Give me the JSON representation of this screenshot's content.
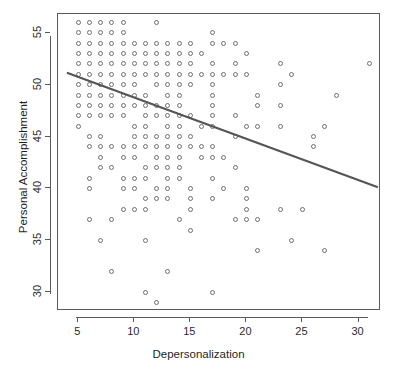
{
  "chart_data": {
    "type": "scatter",
    "title": "",
    "xlabel": "Depersonalization",
    "ylabel": "Personal Accomplishment",
    "xlim": [
      3.2,
      32.0
    ],
    "ylim": [
      28.2,
      56.8
    ],
    "xticks": [
      5,
      10,
      15,
      20,
      25,
      30
    ],
    "xticklabels": [
      "5",
      "10",
      "15",
      "20",
      "25",
      "30"
    ],
    "yticks": [
      30,
      35,
      40,
      45,
      50,
      55
    ],
    "yticklabels": [
      "30",
      "35",
      "40",
      "45",
      "50",
      "55"
    ],
    "grid": false,
    "legend": null,
    "marker": "open-circle",
    "marker_color": "#6e6e6e",
    "line_color": "#555555",
    "frame_color": "#5a5a5a",
    "background": "#ffffff",
    "regression_line": {
      "type": "linear-fit",
      "x_start": 4.0,
      "y_start": 51.1,
      "x_end": 31.9,
      "y_end": 40.0,
      "slope": -0.398,
      "intercept": 52.69
    },
    "points": [
      [
        5,
        56
      ],
      [
        6,
        56
      ],
      [
        7,
        56
      ],
      [
        8,
        56
      ],
      [
        9,
        56
      ],
      [
        12,
        56
      ],
      [
        5,
        55
      ],
      [
        6,
        55
      ],
      [
        7,
        55
      ],
      [
        8,
        55
      ],
      [
        9,
        55
      ],
      [
        17,
        55
      ],
      [
        5,
        54
      ],
      [
        6,
        54
      ],
      [
        7,
        54
      ],
      [
        8,
        54
      ],
      [
        9,
        54
      ],
      [
        10,
        54
      ],
      [
        11,
        54
      ],
      [
        12,
        54
      ],
      [
        13,
        54
      ],
      [
        14,
        54
      ],
      [
        15,
        54
      ],
      [
        17,
        54
      ],
      [
        18,
        54
      ],
      [
        19,
        54
      ],
      [
        5,
        53
      ],
      [
        6,
        53
      ],
      [
        7,
        53
      ],
      [
        8,
        53
      ],
      [
        9,
        53
      ],
      [
        10,
        53
      ],
      [
        11,
        53
      ],
      [
        12,
        53
      ],
      [
        13,
        53
      ],
      [
        14,
        53
      ],
      [
        15,
        53
      ],
      [
        16,
        53
      ],
      [
        20,
        53
      ],
      [
        5,
        52
      ],
      [
        6,
        52
      ],
      [
        7,
        52
      ],
      [
        8,
        52
      ],
      [
        9,
        52
      ],
      [
        10,
        52
      ],
      [
        11,
        52
      ],
      [
        12,
        52
      ],
      [
        13,
        52
      ],
      [
        14,
        52
      ],
      [
        15,
        52
      ],
      [
        17,
        52
      ],
      [
        19,
        52
      ],
      [
        23,
        52
      ],
      [
        31,
        52
      ],
      [
        5,
        51
      ],
      [
        6,
        51
      ],
      [
        7,
        51
      ],
      [
        8,
        51
      ],
      [
        9,
        51
      ],
      [
        10,
        51
      ],
      [
        11,
        51
      ],
      [
        12,
        51
      ],
      [
        13,
        51
      ],
      [
        14,
        51
      ],
      [
        15,
        51
      ],
      [
        16,
        51
      ],
      [
        17,
        51
      ],
      [
        18,
        51
      ],
      [
        19,
        51
      ],
      [
        20,
        51
      ],
      [
        24,
        51
      ],
      [
        5,
        50
      ],
      [
        6,
        50
      ],
      [
        7,
        50
      ],
      [
        8,
        50
      ],
      [
        9,
        50
      ],
      [
        10,
        50
      ],
      [
        12,
        50
      ],
      [
        13,
        50
      ],
      [
        14,
        50
      ],
      [
        15,
        50
      ],
      [
        17,
        50
      ],
      [
        23,
        50
      ],
      [
        5,
        49
      ],
      [
        6,
        49
      ],
      [
        7,
        49
      ],
      [
        8,
        49
      ],
      [
        9,
        49
      ],
      [
        10,
        49
      ],
      [
        11,
        49
      ],
      [
        13,
        49
      ],
      [
        14,
        49
      ],
      [
        17,
        49
      ],
      [
        21,
        49
      ],
      [
        28,
        49
      ],
      [
        5,
        48
      ],
      [
        6,
        48
      ],
      [
        7,
        48
      ],
      [
        8,
        48
      ],
      [
        9,
        48
      ],
      [
        10,
        48
      ],
      [
        11,
        48
      ],
      [
        12,
        48
      ],
      [
        13,
        48
      ],
      [
        14,
        48
      ],
      [
        17,
        48
      ],
      [
        21,
        48
      ],
      [
        23,
        48
      ],
      [
        5,
        47
      ],
      [
        6,
        47
      ],
      [
        7,
        47
      ],
      [
        8,
        47
      ],
      [
        9,
        47
      ],
      [
        11,
        47
      ],
      [
        12,
        47
      ],
      [
        13,
        47
      ],
      [
        14,
        47
      ],
      [
        15,
        47
      ],
      [
        17,
        47
      ],
      [
        19,
        47
      ],
      [
        5,
        46
      ],
      [
        10,
        46
      ],
      [
        11,
        46
      ],
      [
        13,
        46
      ],
      [
        14,
        46
      ],
      [
        16,
        46
      ],
      [
        17,
        46
      ],
      [
        20,
        46
      ],
      [
        21,
        46
      ],
      [
        23,
        46
      ],
      [
        27,
        46
      ],
      [
        6,
        45
      ],
      [
        7,
        45
      ],
      [
        10,
        45
      ],
      [
        11,
        45
      ],
      [
        12,
        45
      ],
      [
        13,
        45
      ],
      [
        14,
        45
      ],
      [
        15,
        45
      ],
      [
        19,
        45
      ],
      [
        26,
        45
      ],
      [
        6,
        44
      ],
      [
        7,
        44
      ],
      [
        8,
        44
      ],
      [
        9,
        44
      ],
      [
        10,
        44
      ],
      [
        11,
        44
      ],
      [
        12,
        44
      ],
      [
        13,
        44
      ],
      [
        14,
        44
      ],
      [
        15,
        44
      ],
      [
        16,
        44
      ],
      [
        17,
        44
      ],
      [
        26,
        44
      ],
      [
        7,
        43
      ],
      [
        9,
        43
      ],
      [
        10,
        43
      ],
      [
        12,
        43
      ],
      [
        13,
        43
      ],
      [
        14,
        43
      ],
      [
        16,
        43
      ],
      [
        17,
        43
      ],
      [
        18,
        43
      ],
      [
        7,
        42
      ],
      [
        8,
        42
      ],
      [
        11,
        42
      ],
      [
        12,
        42
      ],
      [
        13,
        42
      ],
      [
        14,
        42
      ],
      [
        19,
        42
      ],
      [
        6,
        41
      ],
      [
        9,
        41
      ],
      [
        10,
        41
      ],
      [
        11,
        41
      ],
      [
        13,
        41
      ],
      [
        14,
        41
      ],
      [
        17,
        41
      ],
      [
        6,
        40
      ],
      [
        9,
        40
      ],
      [
        10,
        40
      ],
      [
        12,
        40
      ],
      [
        13,
        40
      ],
      [
        15,
        40
      ],
      [
        18,
        40
      ],
      [
        20,
        40
      ],
      [
        11,
        39
      ],
      [
        12,
        39
      ],
      [
        13,
        39
      ],
      [
        15,
        39
      ],
      [
        17,
        39
      ],
      [
        20,
        39
      ],
      [
        9,
        38
      ],
      [
        10,
        38
      ],
      [
        11,
        38
      ],
      [
        15,
        38
      ],
      [
        20,
        38
      ],
      [
        23,
        38
      ],
      [
        25,
        38
      ],
      [
        6,
        37
      ],
      [
        8,
        37
      ],
      [
        14,
        37
      ],
      [
        19,
        37
      ],
      [
        20,
        37
      ],
      [
        21,
        37
      ],
      [
        15,
        36
      ],
      [
        7,
        35
      ],
      [
        11,
        35
      ],
      [
        24,
        35
      ],
      [
        21,
        34
      ],
      [
        27,
        34
      ],
      [
        8,
        32
      ],
      [
        13,
        32
      ],
      [
        11,
        30
      ],
      [
        17,
        30
      ],
      [
        12,
        29
      ]
    ]
  }
}
